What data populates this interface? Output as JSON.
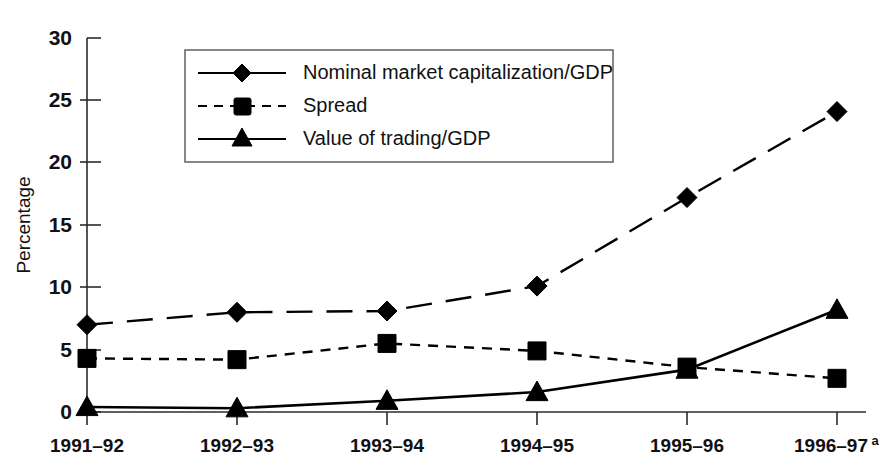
{
  "chart_data": {
    "type": "line",
    "title": "",
    "xlabel": "",
    "ylabel": "Percentage",
    "ylim": [
      0,
      30
    ],
    "yticks": [
      0,
      5,
      10,
      15,
      20,
      25,
      30
    ],
    "ytick_labels": [
      "0",
      "5",
      "10",
      "15",
      "20",
      "25",
      "30"
    ],
    "grid": false,
    "legend_position": "upper-left-inside",
    "categories": [
      "1991–92",
      "1992–93",
      "1993–94",
      "1994–95",
      "1995–96",
      "1996–97"
    ],
    "category_superscripts": [
      "",
      "",
      "",
      "",
      "",
      "a"
    ],
    "series": [
      {
        "name": "Nominal market capitalization/GDP",
        "marker": "diamond",
        "linestyle": "dashed-long",
        "values": [
          7.0,
          8.0,
          8.1,
          10.1,
          17.2,
          24.1
        ]
      },
      {
        "name": "Spread",
        "marker": "square",
        "linestyle": "dashed-short",
        "values": [
          4.3,
          4.2,
          5.5,
          4.9,
          3.6,
          2.7
        ]
      },
      {
        "name": "Value of trading/GDP",
        "marker": "triangle",
        "linestyle": "solid",
        "values": [
          0.4,
          0.3,
          0.9,
          1.6,
          3.4,
          8.2
        ]
      }
    ],
    "colors": {
      "series": "#000000",
      "axis": "#2b2b2b",
      "background": "#ffffff",
      "legend_border": "#555555"
    }
  },
  "legend": {
    "entries": [
      {
        "label": "Nominal market capitalization/GDP",
        "marker": "diamond-icon",
        "style": "long-dash"
      },
      {
        "label": "Spread",
        "marker": "square-icon",
        "style": "short-dash"
      },
      {
        "label": "Value of trading/GDP",
        "marker": "triangle-icon",
        "style": "solid"
      }
    ]
  }
}
